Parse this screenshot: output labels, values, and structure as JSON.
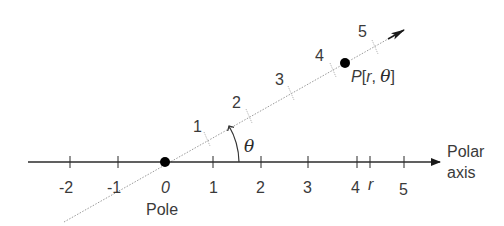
{
  "diagram": {
    "polar_axis": {
      "label_line1": "Polar",
      "label_line2": "axis",
      "ticks": [
        {
          "label": "-2",
          "value": -2
        },
        {
          "label": "-1",
          "value": -1
        },
        {
          "label": "0",
          "value": 0
        },
        {
          "label": "1",
          "value": 1
        },
        {
          "label": "2",
          "value": 2
        },
        {
          "label": "3",
          "value": 3
        },
        {
          "label": "4",
          "value": 4
        },
        {
          "label": "r",
          "value": 4.27
        },
        {
          "label": "5",
          "value": 5
        }
      ]
    },
    "pole": {
      "label": "Pole",
      "origin_label": "0"
    },
    "ray": {
      "style": "dotted",
      "ticks": [
        "1",
        "2",
        "3",
        "4",
        "5"
      ]
    },
    "point": {
      "name": "P",
      "label": "P[r, θ]",
      "label_p": "P",
      "label_open": "[",
      "label_r": "r",
      "label_comma": ", ",
      "label_theta": "θ",
      "label_close": "]"
    },
    "angle": {
      "symbol": "θ"
    },
    "colors": {
      "line": "#2b2b2b",
      "dotted_ray": "#9a9a9a",
      "text": "#3a3a3a",
      "point": "#000000"
    }
  }
}
